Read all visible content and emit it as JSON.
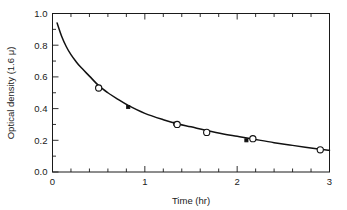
{
  "chart_data": {
    "type": "scatter",
    "title": "",
    "xlabel": "Time (hr)",
    "ylabel": "Optical density (1.6 μ)",
    "xlim": [
      0,
      3
    ],
    "ylim": [
      0.0,
      1.0
    ],
    "grid": false,
    "legend_position": "none",
    "x_major_ticks": [
      0,
      1,
      2,
      3
    ],
    "x_major_tick_labels": [
      "0",
      "1",
      "2",
      "3"
    ],
    "x_minor_tick_interval": 0.2,
    "y_major_ticks": [
      0.0,
      0.2,
      0.4,
      0.6,
      0.8,
      1.0
    ],
    "y_major_tick_labels": [
      "0.0",
      "0.2",
      "0.4",
      "0.6",
      "0.8",
      "1.0"
    ],
    "y_minor_tick_interval": 0.1,
    "series": [
      {
        "name": "open-circle-points",
        "marker": "open-circle",
        "x": [
          0.5,
          1.35,
          1.67,
          2.17,
          2.9
        ],
        "y": [
          0.53,
          0.3,
          0.25,
          0.21,
          0.14
        ]
      },
      {
        "name": "filled-square-points",
        "marker": "filled-square",
        "x": [
          0.82,
          1.33,
          2.1
        ],
        "y": [
          0.41,
          0.305,
          0.2
        ]
      },
      {
        "name": "fitted-decay-curve",
        "marker": "none",
        "x": [
          0.05,
          0.1,
          0.15,
          0.2,
          0.25,
          0.3,
          0.4,
          0.5,
          0.6,
          0.7,
          0.82,
          1.0,
          1.2,
          1.35,
          1.5,
          1.67,
          1.85,
          2.0,
          2.17,
          2.4,
          2.6,
          2.9,
          3.0
        ],
        "y": [
          0.94,
          0.855,
          0.79,
          0.74,
          0.7,
          0.665,
          0.605,
          0.545,
          0.5,
          0.462,
          0.42,
          0.37,
          0.33,
          0.305,
          0.285,
          0.262,
          0.24,
          0.225,
          0.208,
          0.185,
          0.168,
          0.143,
          0.137
        ]
      }
    ],
    "colors": {
      "axis": "#1a1a1a",
      "curve": "#111111",
      "marker_fill_open": "#ffffff",
      "marker_fill_closed": "#111111",
      "background": "#ffffff"
    }
  },
  "axes": {
    "x_label": "Time (hr)",
    "y_label": "Optical density (1.6 μ)",
    "x_tick_labels": [
      "0",
      "1",
      "2",
      "3"
    ],
    "y_tick_labels": [
      "0.0",
      "0.2",
      "0.4",
      "0.6",
      "0.8",
      "1.0"
    ]
  }
}
